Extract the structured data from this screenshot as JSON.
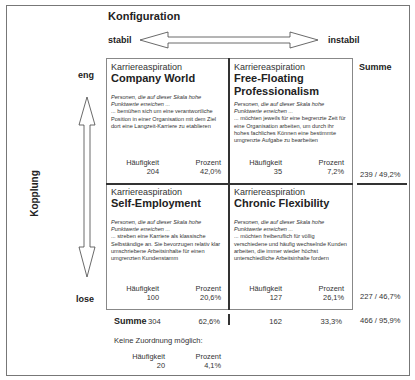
{
  "title": "Konfiguration",
  "axis_x": {
    "left": "stabil",
    "right": "instabil"
  },
  "axis_y": {
    "label": "Kopplung",
    "top": "eng",
    "bottom": "lose"
  },
  "sum_header": "Summe",
  "stat_labels": {
    "freq": "Häufigkeit",
    "pct": "Prozent"
  },
  "quadrants": [
    {
      "kicker": "Karriereaspiration",
      "name": "Company World",
      "intro": "Personen, die auf dieser Skala hohe Punktwerte erreichen ...",
      "text": "... bemühen sich um eine verantwortliche Position in einer Organisation mit dem Ziel dort eine Langzeit-Karriere zu etablieren",
      "freq": "204",
      "pct": "42,0%"
    },
    {
      "kicker": "Karriereaspiration",
      "name": "Free-Floating Professionalism",
      "intro": "Personen, die auf dieser Skala hohe Punktwerte erreichen ...",
      "text": "... möchten jeweils für eine begrenzte Zeit für eine Organisation arbeiten, um durch ihr hohes fachliches Können eine bestimmte umgrenzte Aufgabe zu bearbeiten",
      "freq": "35",
      "pct": "7,2%"
    },
    {
      "kicker": "Karriereaspiration",
      "name": "Self-Employment",
      "intro": "Personen, die auf dieser Skala hohe Punktwerte erreichen ...",
      "text": "... streben eine Karriere als klassische Selbständige an. Sie bevorzugen relativ klar umschriebene Arbeitsinhalte für einen umgrenzten Kundenstamm",
      "freq": "100",
      "pct": "20,6%"
    },
    {
      "kicker": "Karriereaspiration",
      "name": "Chronic Flexibility",
      "intro": "Personen, die auf dieser Skala hohe Punktwerte erreichen ...",
      "text": "... möchten freiberuflich für völlig verschiedene und häufig wechselnde Kunden arbeiten, die immer wieder höchst unterschiedliche Arbeitsinhalte fordern",
      "freq": "127",
      "pct": "26,1%"
    }
  ],
  "row_sums": [
    "239 / 49,2%",
    "227 / 46,7%"
  ],
  "col_sums": {
    "label": "Summe",
    "left_freq": "304",
    "left_pct": "62,6%",
    "right_freq": "162",
    "right_pct": "33,3%",
    "total": "466 / 95,9%"
  },
  "unassigned": {
    "label": "Keine Zuordnung möglich:",
    "freq": "20",
    "pct": "4,1%"
  }
}
